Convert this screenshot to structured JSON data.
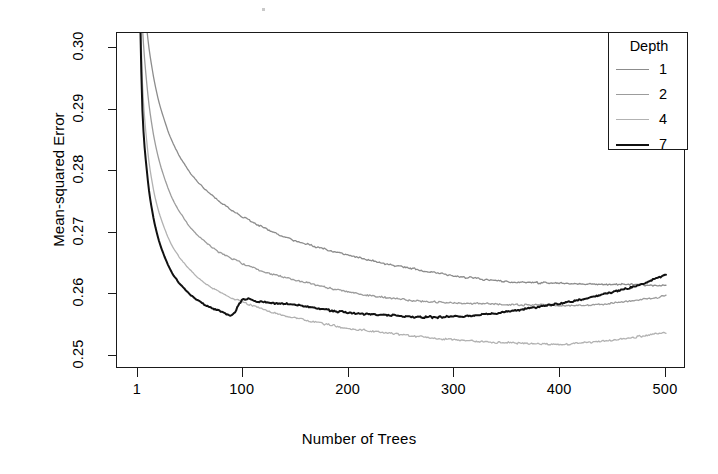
{
  "chart_data": {
    "type": "line",
    "title": "",
    "xlabel": "Number of Trees",
    "ylabel": "Mean-squared Error",
    "xlim": [
      1,
      500
    ],
    "ylim": [
      0.245,
      0.302
    ],
    "xticks": [
      1,
      100,
      200,
      300,
      400,
      500
    ],
    "xtick_labels": [
      "1",
      "100",
      "200",
      "300",
      "400",
      "500"
    ],
    "yticks": [
      0.25,
      0.26,
      0.27,
      0.28,
      0.29,
      0.3
    ],
    "ytick_labels": [
      "0.25",
      "0.26",
      "0.27",
      "0.28",
      "0.29",
      "0.30"
    ],
    "grid": false,
    "legend_position": "top-right",
    "legend_title": "Depth",
    "series": [
      {
        "name": "1",
        "color": "#8c8c8c",
        "width": 1.3,
        "x": [
          1,
          5,
          10,
          15,
          20,
          25,
          30,
          35,
          40,
          50,
          60,
          70,
          80,
          90,
          100,
          115,
          130,
          145,
          160,
          180,
          200,
          220,
          240,
          260,
          280,
          300,
          320,
          340,
          360,
          380,
          400,
          420,
          440,
          460,
          480,
          500
        ],
        "y": [
          0.328,
          0.312,
          0.302,
          0.296,
          0.2918,
          0.2888,
          0.2862,
          0.2842,
          0.2824,
          0.2798,
          0.2778,
          0.2762,
          0.2748,
          0.2736,
          0.2726,
          0.2712,
          0.27,
          0.269,
          0.2682,
          0.2672,
          0.2664,
          0.2656,
          0.2648,
          0.2642,
          0.2636,
          0.263,
          0.2626,
          0.2622,
          0.262,
          0.2619,
          0.2618,
          0.2617,
          0.2616,
          0.2616,
          0.2615,
          0.2614
        ]
      },
      {
        "name": "2",
        "color": "#9c9c9c",
        "width": 1.3,
        "x": [
          1,
          5,
          10,
          15,
          20,
          25,
          30,
          35,
          40,
          50,
          60,
          70,
          80,
          90,
          100,
          115,
          130,
          145,
          160,
          180,
          200,
          220,
          240,
          260,
          280,
          300,
          320,
          340,
          360,
          380,
          400,
          420,
          440,
          460,
          480,
          500
        ],
        "y": [
          0.3245,
          0.304,
          0.293,
          0.2866,
          0.2824,
          0.2794,
          0.277,
          0.275,
          0.2734,
          0.271,
          0.2692,
          0.2678,
          0.2666,
          0.2658,
          0.265,
          0.264,
          0.2632,
          0.2625,
          0.2619,
          0.2611,
          0.2604,
          0.2598,
          0.2594,
          0.259,
          0.2588,
          0.2586,
          0.2585,
          0.2584,
          0.2583,
          0.2583,
          0.2582,
          0.2582,
          0.2584,
          0.2588,
          0.2592,
          0.2597
        ]
      },
      {
        "name": "4",
        "color": "#b2b2b2",
        "width": 1.3,
        "x": [
          1,
          5,
          10,
          15,
          20,
          25,
          30,
          35,
          40,
          50,
          60,
          70,
          80,
          90,
          100,
          115,
          130,
          145,
          160,
          180,
          200,
          220,
          240,
          260,
          280,
          300,
          320,
          340,
          360,
          380,
          400,
          420,
          440,
          460,
          480,
          500
        ],
        "y": [
          0.321,
          0.295,
          0.2836,
          0.2776,
          0.2738,
          0.2712,
          0.269,
          0.2674,
          0.266,
          0.264,
          0.2624,
          0.2612,
          0.2602,
          0.2594,
          0.2588,
          0.2578,
          0.257,
          0.2563,
          0.2558,
          0.2551,
          0.2545,
          0.2541,
          0.2537,
          0.2533,
          0.2529,
          0.2526,
          0.2524,
          0.2522,
          0.2521,
          0.252,
          0.2519,
          0.2521,
          0.2524,
          0.2528,
          0.2533,
          0.2538
        ]
      },
      {
        "name": "7",
        "color": "#111111",
        "width": 2.0,
        "x": [
          1,
          5,
          10,
          15,
          20,
          25,
          30,
          35,
          40,
          50,
          60,
          70,
          80,
          90,
          100,
          115,
          130,
          145,
          160,
          180,
          200,
          220,
          240,
          260,
          280,
          300,
          320,
          340,
          360,
          380,
          400,
          420,
          440,
          460,
          480,
          500
        ],
        "y": [
          0.319,
          0.2905,
          0.279,
          0.273,
          0.2692,
          0.2666,
          0.2646,
          0.263,
          0.2618,
          0.26,
          0.2588,
          0.2578,
          0.2572,
          0.2566,
          0.2592,
          0.2588,
          0.2586,
          0.2584,
          0.258,
          0.2575,
          0.257,
          0.2568,
          0.2566,
          0.2564,
          0.2563,
          0.2564,
          0.2566,
          0.257,
          0.2575,
          0.258,
          0.2586,
          0.2592,
          0.26,
          0.2608,
          0.2618,
          0.2632
        ]
      }
    ]
  },
  "axes": {
    "y_title": "Mean-squared Error",
    "x_title": "Number of Trees"
  },
  "legend": {
    "title": "Depth",
    "entries": [
      {
        "label": "1",
        "color": "#8c8c8c"
      },
      {
        "label": "2",
        "color": "#9c9c9c"
      },
      {
        "label": "4",
        "color": "#b2b2b2"
      },
      {
        "label": "7",
        "color": "#111111"
      }
    ]
  }
}
